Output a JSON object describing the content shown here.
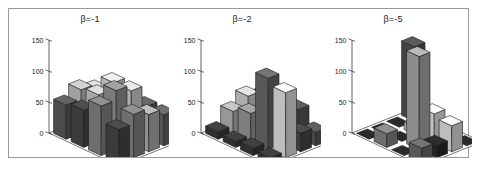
{
  "figure": {
    "background_color": "#ffffff",
    "frame_color": "#9a9a9a",
    "panel_count": 3
  },
  "chart_data": [
    {
      "type": "bar",
      "projection": "3d",
      "title": "β=-1",
      "xlabel": "",
      "ylabel": "",
      "zlabel": "",
      "grid": false,
      "legend": null,
      "axis_ticks": [
        0,
        50,
        100,
        150
      ],
      "tick_labels": [
        "0",
        "50",
        "100",
        "150"
      ],
      "zlim": [
        0,
        150
      ],
      "rows": 4,
      "cols": 4,
      "values": [
        [
          55,
          60,
          80,
          55
        ],
        [
          70,
          75,
          95,
          70
        ],
        [
          60,
          85,
          85,
          60
        ],
        [
          50,
          50,
          50,
          50
        ]
      ],
      "shades": [
        [
          "#5e5e5e",
          "#4a4a4a",
          "#8a8a8a",
          "#4a4a4a"
        ],
        [
          "#c8c8c8",
          "#d2d2d2",
          "#9a9a9a",
          "#8a8a8a"
        ],
        [
          "#d8d8d8",
          "#e2e2e2",
          "#dcdcdc",
          "#b4b4b4"
        ],
        [
          "#6a6a6a",
          "#5e5e5e",
          "#626262",
          "#6a6a6a"
        ]
      ]
    },
    {
      "type": "bar",
      "projection": "3d",
      "title": "β=-2",
      "xlabel": "",
      "ylabel": "",
      "zlabel": "",
      "grid": false,
      "legend": null,
      "axis_ticks": [
        0,
        50,
        100,
        150
      ],
      "tick_labels": [
        "0",
        "50",
        "100",
        "150"
      ],
      "zlim": [
        0,
        150
      ],
      "rows": 4,
      "cols": 4,
      "values": [
        [
          12,
          10,
          12,
          10
        ],
        [
          35,
          45,
          115,
          105
        ],
        [
          50,
          38,
          60,
          30
        ],
        [
          40,
          42,
          45,
          22
        ]
      ],
      "shades": [
        [
          "#3c3c3c",
          "#3c3c3c",
          "#3c3c3c",
          "#3c3c3c"
        ],
        [
          "#bdbdbd",
          "#9e9e9e",
          "#6e6e6e",
          "#ececec"
        ],
        [
          "#d8d8d8",
          "#e6e6e6",
          "#efefef",
          "#4a4a4a"
        ],
        [
          "#787878",
          "#5a5a5a",
          "#5a5a5a",
          "#5a5a5a"
        ]
      ]
    },
    {
      "type": "bar",
      "projection": "3d",
      "title": "β=-5",
      "xlabel": "",
      "ylabel": "",
      "zlabel": "",
      "grid": false,
      "legend": null,
      "axis_ticks": [
        0,
        50,
        100,
        150
      ],
      "tick_labels": [
        "0",
        "50",
        "100",
        "150"
      ],
      "zlim": [
        0,
        150
      ],
      "rows": 4,
      "cols": 4,
      "values": [
        [
          0,
          22,
          0,
          25
        ],
        [
          0,
          0,
          150,
          20
        ],
        [
          0,
          12,
          48,
          42
        ],
        [
          120,
          0,
          0,
          0
        ]
      ],
      "shades": [
        [
          "#2a2a2a",
          "#8a8a8a",
          "#2a2a2a",
          "#6e6e6e"
        ],
        [
          "#2a2a2a",
          "#2a2a2a",
          "#b0b0b0",
          "#2a2a2a"
        ],
        [
          "#2a2a2a",
          "#d4d4d4",
          "#f2f2f2",
          "#ececec"
        ],
        [
          "#555555",
          "#2a2a2a",
          "#2a2a2a",
          "#2a2a2a"
        ]
      ]
    }
  ]
}
